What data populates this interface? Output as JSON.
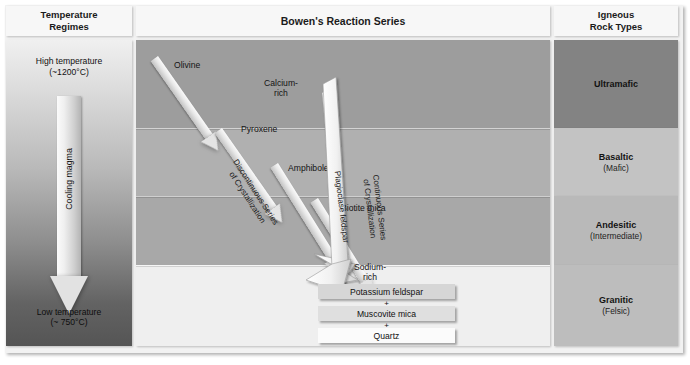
{
  "headers": {
    "temperature": "Temperature\nRegimes",
    "temperature_l1": "Temperature",
    "temperature_l2": "Regimes",
    "main": "Bowen's Reaction Series",
    "rock_l1": "Igneous",
    "rock_l2": "Rock Types"
  },
  "temperature": {
    "high_l1": "High temperature",
    "high_l2": "(~1200°C)",
    "low_l1": "Low temperature",
    "low_l2": "(~ 750°C)",
    "arrow_label": "Cooling magma"
  },
  "series": {
    "discontinuous_l1": "Discontinuous Series",
    "discontinuous_l2": "of Crystallization",
    "continuous_l1": "Continuous Series",
    "continuous_l2": "of Crystallization",
    "plagioclase_label": "Plagioclase feldspar",
    "calcium_l1": "Calcium-",
    "calcium_l2": "rich",
    "sodium_l1": "Sodium-",
    "sodium_l2": "rich"
  },
  "minerals": [
    {
      "name": "Olivine"
    },
    {
      "name": "Pyroxene"
    },
    {
      "name": "Amphibole"
    },
    {
      "name": "Biotite mica"
    }
  ],
  "results": [
    {
      "name": "Potassium feldspar"
    },
    {
      "name": "Muscovite mica"
    },
    {
      "name": "Quartz"
    }
  ],
  "plus_sign": "+",
  "rock_types": [
    {
      "name": "Ultramafic",
      "sub": ""
    },
    {
      "name": "Basaltic",
      "sub": "(Mafic)"
    },
    {
      "name": "Andesitic",
      "sub": "(Intermediate)"
    },
    {
      "name": "Granitic",
      "sub": "(Felsic)"
    }
  ],
  "colors": {
    "band_ultramafic": "#9d9d9d",
    "band_basaltic": "#b0b0b0",
    "band_andesitic": "#a8a8a8",
    "band_granitic": "#efefef",
    "rock_ultramafic": "#838383",
    "rock_basaltic": "#c3c3c3",
    "rock_andesitic": "#b9b9b9",
    "rock_granitic": "#bdbdbd",
    "frame": "#f2f2f2",
    "arrow": "#e4e4e4"
  }
}
